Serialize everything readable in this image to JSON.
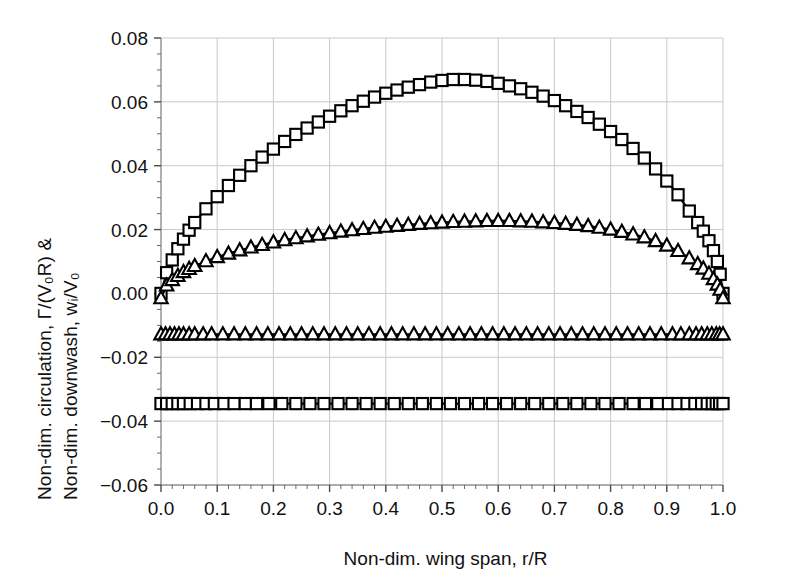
{
  "chart_data": {
    "type": "line",
    "title": "",
    "xlabel": "Non-dim. wing span, r/R",
    "ylabel_line1": "Non-dim. circulation, Γ/(V₀R) &",
    "ylabel_line2": "Non-dim. downwash, wᵢ/V₀",
    "xlim": [
      0.0,
      1.0
    ],
    "ylim": [
      -0.06,
      0.08
    ],
    "xticks": [
      "0.0",
      "0.1",
      "0.2",
      "0.3",
      "0.4",
      "0.5",
      "0.6",
      "0.7",
      "0.8",
      "0.9",
      "1.0"
    ],
    "xtick_values": [
      0.0,
      0.1,
      0.2,
      0.3,
      0.4,
      0.5,
      0.6,
      0.7,
      0.8,
      0.9,
      1.0
    ],
    "yticks": [
      "0.08",
      "0.06",
      "0.04",
      "0.02",
      "0.00",
      "-0.02",
      "-0.04",
      "-0.06"
    ],
    "ytick_values": [
      0.08,
      0.06,
      0.04,
      0.02,
      0.0,
      -0.02,
      -0.04,
      -0.06
    ],
    "grid": true,
    "minor_ticks": true,
    "legend": "none",
    "marker_colors": {
      "line": "#000000",
      "fill": "#ffffff"
    },
    "series": [
      {
        "name": "circulation-square",
        "marker": "square",
        "x": [
          0.0,
          0.01,
          0.02,
          0.03,
          0.04,
          0.05,
          0.06,
          0.08,
          0.1,
          0.12,
          0.14,
          0.16,
          0.18,
          0.2,
          0.22,
          0.24,
          0.26,
          0.28,
          0.3,
          0.32,
          0.34,
          0.36,
          0.38,
          0.4,
          0.42,
          0.44,
          0.46,
          0.48,
          0.5,
          0.52,
          0.54,
          0.56,
          0.58,
          0.6,
          0.62,
          0.64,
          0.66,
          0.68,
          0.7,
          0.72,
          0.74,
          0.76,
          0.78,
          0.8,
          0.82,
          0.84,
          0.86,
          0.88,
          0.9,
          0.92,
          0.94,
          0.955,
          0.965,
          0.975,
          0.983,
          0.99,
          0.995,
          1.0
        ],
        "y": [
          0.0,
          0.0065,
          0.0105,
          0.014,
          0.017,
          0.0198,
          0.0222,
          0.0265,
          0.0303,
          0.0338,
          0.037,
          0.04,
          0.0427,
          0.0452,
          0.0476,
          0.0498,
          0.0518,
          0.0537,
          0.0555,
          0.0572,
          0.0588,
          0.0602,
          0.0615,
          0.0627,
          0.0637,
          0.0646,
          0.0654,
          0.0662,
          0.0667,
          0.067,
          0.067,
          0.0668,
          0.0664,
          0.0658,
          0.065,
          0.0641,
          0.063,
          0.0618,
          0.0604,
          0.0588,
          0.057,
          0.0551,
          0.053,
          0.0507,
          0.0482,
          0.0454,
          0.0424,
          0.039,
          0.0352,
          0.0309,
          0.0258,
          0.0222,
          0.0195,
          0.0165,
          0.0134,
          0.01,
          0.006,
          0.0
        ]
      },
      {
        "name": "circulation-triangle",
        "marker": "triangle",
        "x": [
          0.0,
          0.01,
          0.02,
          0.03,
          0.04,
          0.05,
          0.06,
          0.08,
          0.1,
          0.12,
          0.14,
          0.16,
          0.18,
          0.2,
          0.22,
          0.24,
          0.26,
          0.28,
          0.3,
          0.32,
          0.34,
          0.36,
          0.38,
          0.4,
          0.42,
          0.44,
          0.46,
          0.48,
          0.5,
          0.52,
          0.54,
          0.56,
          0.58,
          0.6,
          0.62,
          0.64,
          0.66,
          0.68,
          0.7,
          0.72,
          0.74,
          0.76,
          0.78,
          0.8,
          0.82,
          0.84,
          0.86,
          0.88,
          0.9,
          0.92,
          0.94,
          0.955,
          0.965,
          0.975,
          0.983,
          0.99,
          0.995,
          1.0
        ],
        "y": [
          -0.0015,
          0.0025,
          0.0042,
          0.0055,
          0.0067,
          0.0077,
          0.0086,
          0.0101,
          0.0114,
          0.0125,
          0.0135,
          0.0144,
          0.0152,
          0.016,
          0.0167,
          0.0173,
          0.0179,
          0.0184,
          0.0189,
          0.0194,
          0.0198,
          0.0202,
          0.0206,
          0.0209,
          0.0212,
          0.0215,
          0.0218,
          0.022,
          0.0222,
          0.0224,
          0.0225,
          0.0226,
          0.0227,
          0.0227,
          0.0227,
          0.0226,
          0.0225,
          0.0223,
          0.0221,
          0.0218,
          0.0215,
          0.0211,
          0.0206,
          0.02,
          0.0193,
          0.0185,
          0.0176,
          0.0164,
          0.015,
          0.0133,
          0.011,
          0.0092,
          0.0078,
          0.0062,
          0.0045,
          0.0028,
          0.0012,
          -0.0015
        ]
      },
      {
        "name": "downwash-triangle",
        "marker": "triangle",
        "constant": -0.0128,
        "x": [
          0.0,
          0.008,
          0.016,
          0.024,
          0.032,
          0.04,
          0.05,
          0.06,
          0.075,
          0.09,
          0.11,
          0.13,
          0.15,
          0.17,
          0.19,
          0.21,
          0.23,
          0.25,
          0.27,
          0.29,
          0.31,
          0.33,
          0.35,
          0.37,
          0.39,
          0.41,
          0.43,
          0.45,
          0.47,
          0.49,
          0.51,
          0.53,
          0.55,
          0.57,
          0.59,
          0.61,
          0.63,
          0.65,
          0.67,
          0.69,
          0.71,
          0.73,
          0.75,
          0.77,
          0.79,
          0.81,
          0.83,
          0.85,
          0.87,
          0.89,
          0.91,
          0.925,
          0.94,
          0.952,
          0.962,
          0.972,
          0.98,
          0.988,
          0.994,
          1.0
        ],
        "y": [
          -0.0128,
          -0.0128,
          -0.0128,
          -0.0128,
          -0.0128,
          -0.0128,
          -0.0128,
          -0.0128,
          -0.0128,
          -0.0128,
          -0.0128,
          -0.0128,
          -0.0128,
          -0.0128,
          -0.0128,
          -0.0128,
          -0.0128,
          -0.0128,
          -0.0128,
          -0.0128,
          -0.0128,
          -0.0128,
          -0.0128,
          -0.0128,
          -0.0128,
          -0.0128,
          -0.0128,
          -0.0128,
          -0.0128,
          -0.0128,
          -0.0128,
          -0.0128,
          -0.0128,
          -0.0128,
          -0.0128,
          -0.0128,
          -0.0128,
          -0.0128,
          -0.0128,
          -0.0128,
          -0.0128,
          -0.0128,
          -0.0128,
          -0.0128,
          -0.0128,
          -0.0128,
          -0.0128,
          -0.0128,
          -0.0128,
          -0.0128,
          -0.0128,
          -0.0128,
          -0.0128,
          -0.0128,
          -0.0128,
          -0.0128,
          -0.0128,
          -0.0128,
          -0.0128,
          -0.0128
        ]
      },
      {
        "name": "downwash-square",
        "marker": "square",
        "constant": -0.0345,
        "x": [
          0.0,
          0.01,
          0.02,
          0.03,
          0.04,
          0.052,
          0.065,
          0.08,
          0.095,
          0.112,
          0.13,
          0.15,
          0.17,
          0.192,
          0.215,
          0.24,
          0.265,
          0.29,
          0.315,
          0.34,
          0.365,
          0.39,
          0.415,
          0.44,
          0.465,
          0.49,
          0.515,
          0.54,
          0.565,
          0.59,
          0.615,
          0.64,
          0.665,
          0.69,
          0.715,
          0.74,
          0.765,
          0.79,
          0.815,
          0.84,
          0.862,
          0.884,
          0.903,
          0.92,
          0.936,
          0.95,
          0.962,
          0.972,
          0.981,
          0.988,
          0.994,
          1.0
        ],
        "y": [
          -0.0345,
          -0.0345,
          -0.0345,
          -0.0345,
          -0.0345,
          -0.0345,
          -0.0345,
          -0.0345,
          -0.0345,
          -0.0345,
          -0.0345,
          -0.0345,
          -0.0345,
          -0.0345,
          -0.0345,
          -0.0345,
          -0.0345,
          -0.0345,
          -0.0345,
          -0.0345,
          -0.0345,
          -0.0345,
          -0.0345,
          -0.0345,
          -0.0345,
          -0.0345,
          -0.0345,
          -0.0345,
          -0.0345,
          -0.0345,
          -0.0345,
          -0.0345,
          -0.0345,
          -0.0345,
          -0.0345,
          -0.0345,
          -0.0345,
          -0.0345,
          -0.0345,
          -0.0345,
          -0.0345,
          -0.0345,
          -0.0345,
          -0.0345,
          -0.0345,
          -0.0345,
          -0.0345,
          -0.0345,
          -0.0345,
          -0.0345,
          -0.0345,
          -0.0345
        ]
      }
    ]
  }
}
